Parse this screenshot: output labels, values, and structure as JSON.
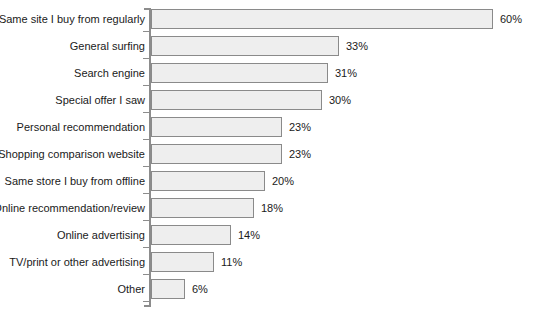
{
  "chart_data": {
    "type": "bar",
    "orientation": "horizontal",
    "title": "",
    "subtitle": "",
    "xlabel": "",
    "ylabel": "",
    "xlim": [
      0,
      60
    ],
    "grid": false,
    "legend": null,
    "value_suffix": "%",
    "categories": [
      "Same site I buy from regularly",
      "General surfing",
      "Search engine",
      "Special offer I saw",
      "Personal recommendation",
      "Shopping comparison website",
      "Same store I buy from offline",
      "Online recommendation/review",
      "Online advertising",
      "TV/print or other advertising",
      "Other"
    ],
    "values": [
      60,
      33,
      31,
      30,
      23,
      23,
      20,
      18,
      14,
      11,
      6
    ],
    "value_labels": [
      "60%",
      "33%",
      "31%",
      "30%",
      "23%",
      "23%",
      "20%",
      "18%",
      "14%",
      "11%",
      "6%"
    ],
    "colors": {
      "bar_fill": "#eeeeee",
      "bar_border": "#8a8a8a",
      "axis": "#8c8c8c",
      "text": "#1a1a1a",
      "background": "#ffffff"
    }
  }
}
